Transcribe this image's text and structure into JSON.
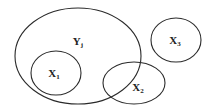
{
  "diagram": {
    "type": "venn-sets",
    "stroke_color": "#2a2a2a",
    "sets": [
      {
        "id": "Y",
        "base": "Y",
        "sub": "j",
        "cx": 78,
        "cy": 56,
        "rx": 63,
        "ry": 48,
        "label_x": 78,
        "label_y": 45
      },
      {
        "id": "X1",
        "base": "X",
        "sub": "1",
        "cx": 56,
        "cy": 73,
        "rx": 25,
        "ry": 22,
        "label_x": 54,
        "label_y": 77
      },
      {
        "id": "X2",
        "base": "X",
        "sub": "2",
        "cx": 134,
        "cy": 83,
        "rx": 31,
        "ry": 21,
        "label_x": 138,
        "label_y": 91
      },
      {
        "id": "X3",
        "base": "X",
        "sub": "3",
        "cx": 176,
        "cy": 40,
        "rx": 25,
        "ry": 22,
        "label_x": 175,
        "label_y": 44
      }
    ]
  }
}
